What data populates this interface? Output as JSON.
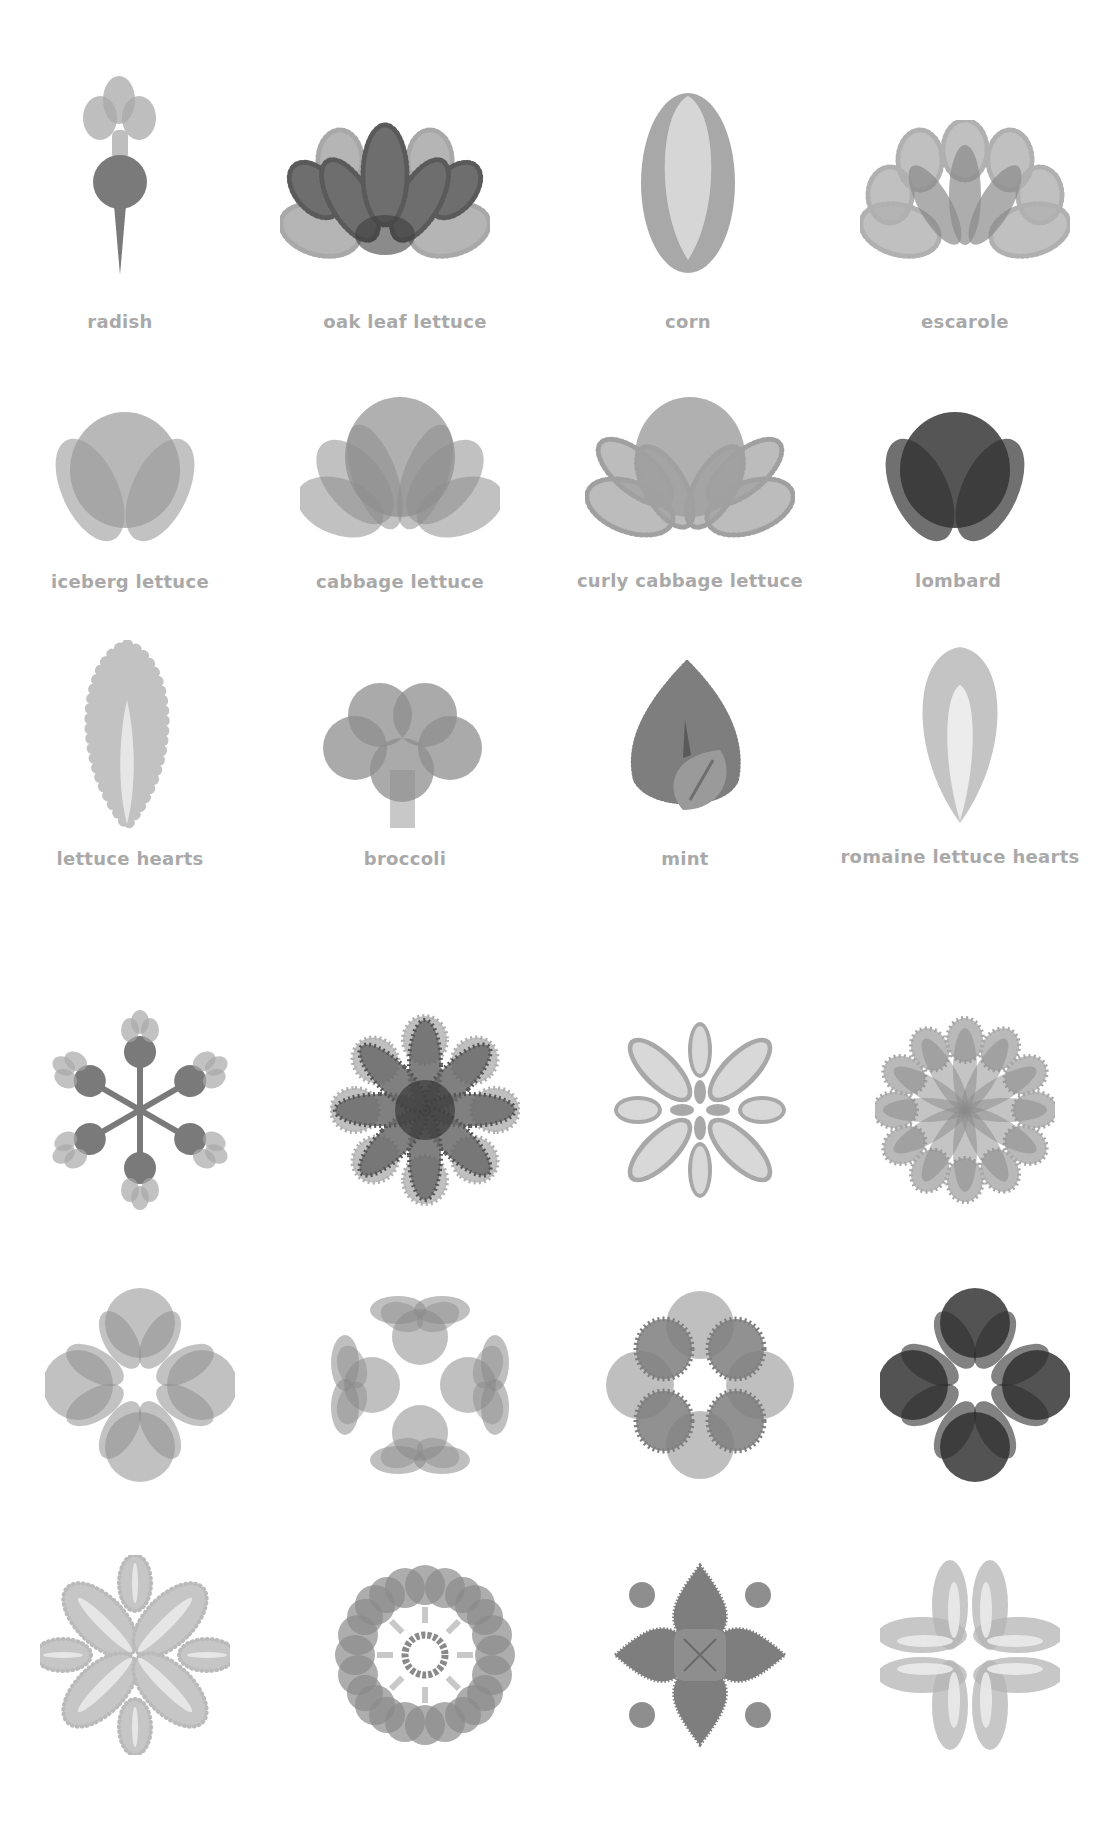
{
  "palette": {
    "light": "#c6c6c6",
    "mid": "#a8a8a8",
    "dark": "#7a7a7a",
    "darker": "#555555",
    "darkest": "#3e3e3e",
    "pale": "#e2e2e2",
    "label": "#a9a9a9"
  },
  "vegetables": [
    {
      "label": "radish",
      "icon": "radish-icon"
    },
    {
      "label": "oak leaf lettuce",
      "icon": "oak-leaf-lettuce-icon"
    },
    {
      "label": "corn",
      "icon": "corn-icon"
    },
    {
      "label": "escarole",
      "icon": "escarole-icon"
    },
    {
      "label": "iceberg lettuce",
      "icon": "iceberg-lettuce-icon"
    },
    {
      "label": "cabbage lettuce",
      "icon": "cabbage-lettuce-icon"
    },
    {
      "label": "curly cabbage lettuce",
      "icon": "curly-cabbage-lettuce-icon"
    },
    {
      "label": "lombard",
      "icon": "lombard-icon"
    },
    {
      "label": "lettuce hearts",
      "icon": "lettuce-hearts-icon"
    },
    {
      "label": "broccoli",
      "icon": "broccoli-icon"
    },
    {
      "label": "mint",
      "icon": "mint-icon"
    },
    {
      "label": "romaine lettuce hearts",
      "icon": "romaine-lettuce-hearts-icon"
    }
  ],
  "patterns": [
    {
      "icon": "radish-snowflake-pattern-icon"
    },
    {
      "icon": "oak-leaf-rosette-pattern-icon"
    },
    {
      "icon": "corn-flower-pattern-icon"
    },
    {
      "icon": "escarole-rosette-pattern-icon"
    },
    {
      "icon": "iceberg-quatrefoil-pattern-icon"
    },
    {
      "icon": "cabbage-ring-pattern-icon"
    },
    {
      "icon": "curly-cabbage-quatrefoil-pattern-icon"
    },
    {
      "icon": "lombard-quatrefoil-pattern-icon"
    },
    {
      "icon": "lettuce-hearts-star-pattern-icon"
    },
    {
      "icon": "broccoli-wreath-pattern-icon"
    },
    {
      "icon": "mint-diamond-pattern-icon"
    },
    {
      "icon": "romaine-clover-pattern-icon"
    }
  ]
}
